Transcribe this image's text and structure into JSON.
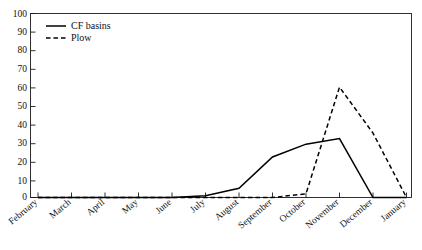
{
  "chart_data": {
    "type": "line",
    "title": "",
    "xlabel": "",
    "ylabel": "",
    "categories": [
      "February",
      "March",
      "April",
      "May",
      "June",
      "July",
      "August",
      "September",
      "October",
      "November",
      "December",
      "January"
    ],
    "series": [
      {
        "name": "CF basins",
        "style": "solid",
        "color": "#000000",
        "values": [
          0,
          0,
          0,
          0,
          0,
          1,
          5,
          22,
          29,
          32,
          0,
          0
        ]
      },
      {
        "name": "Plow",
        "style": "dashed",
        "color": "#000000",
        "values": [
          0,
          0,
          0,
          0,
          0,
          0,
          0,
          0,
          2,
          60,
          35,
          0
        ]
      }
    ],
    "ylim": [
      0,
      100
    ],
    "yticks": [
      0,
      10,
      20,
      30,
      40,
      50,
      60,
      70,
      80,
      90,
      100
    ],
    "ytick_labels": [
      "0",
      "10",
      "20",
      "30",
      "40",
      "50",
      "60",
      "70",
      "80",
      "90",
      "100"
    ],
    "grid": false,
    "legend_position": "top-left",
    "legend_entries": [
      {
        "label": "CF basins",
        "style": "solid"
      },
      {
        "label": "Plow",
        "style": "dashed"
      }
    ]
  },
  "axes": {
    "y_labels": [
      "100",
      "90",
      "80",
      "70",
      "60",
      "50",
      "40",
      "30",
      "20",
      "10",
      "0"
    ],
    "x_labels": [
      "February",
      "March",
      "April",
      "May",
      "June",
      "July",
      "August",
      "September",
      "October",
      "November",
      "December",
      "January"
    ]
  },
  "legend": {
    "item1_label": "CF basins",
    "item2_label": "Plow"
  }
}
